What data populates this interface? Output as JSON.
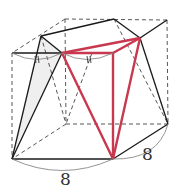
{
  "diagram": {
    "type": "geometry-solid",
    "labels": {
      "bottom_edge": "8",
      "right_edge": "8",
      "tick_mark_left": "||",
      "tick_mark_right": "||"
    },
    "colors": {
      "solid_edge": "#1a1a1a",
      "hidden_edge": "#444444",
      "highlight": "#c8384f",
      "arc": "#888888",
      "shade": "#ececec"
    }
  }
}
